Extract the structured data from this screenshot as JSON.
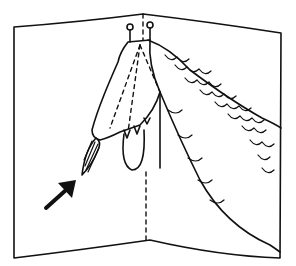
{
  "illustration": {
    "subject": "pop-up card with crocodile head",
    "colors": {
      "ink": "#111111",
      "paper": "#ffffff"
    },
    "elements": [
      "card-outline",
      "center-fold",
      "crocodile-head",
      "crocodile-body-scales",
      "tongue",
      "hatched-leaf",
      "pointer-arrow"
    ]
  }
}
